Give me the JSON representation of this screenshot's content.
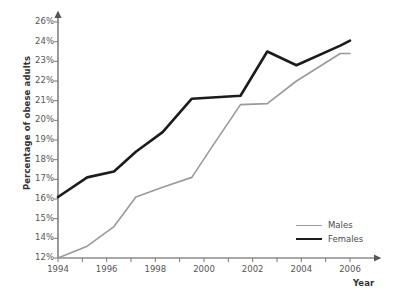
{
  "chart_data": {
    "type": "line",
    "title": "",
    "xlabel": "Year",
    "ylabel": "Percentage of obese adults",
    "xlim": [
      1994,
      2007
    ],
    "ylim": [
      12,
      26
    ],
    "grid": false,
    "legend_position": "bottom-right",
    "x_tick_labels": [
      "1994",
      "1996",
      "1998",
      "2000",
      "2002",
      "2004",
      "2006"
    ],
    "x_tick_values": [
      1994,
      1996,
      1998,
      2000,
      2002,
      2004,
      2006
    ],
    "y_tick_labels": [
      "26%",
      "24%",
      "23%",
      "22%",
      "21%",
      "20%",
      "19%",
      "18%",
      "17%",
      "16%",
      "15%",
      "14%",
      "12%"
    ],
    "y_tick_values": [
      26,
      24,
      23,
      22,
      21,
      20,
      19,
      18,
      17,
      16,
      15,
      14,
      12
    ],
    "series": [
      {
        "name": "Males",
        "color": "#9a9a9a",
        "line_width": 1.6,
        "x": [
          1994,
          1995.2,
          1996.3,
          1997.2,
          1998.3,
          1999.5,
          2000.3,
          2001.5,
          2002.6,
          2003.8,
          2005.6,
          2006
        ],
        "values": [
          12.0,
          13.2,
          14.6,
          16.1,
          16.6,
          17.1,
          18.6,
          20.8,
          20.85,
          22.0,
          23.4,
          23.4
        ]
      },
      {
        "name": "Females",
        "color": "#1c1c1c",
        "line_width": 2.6,
        "x": [
          1994,
          1995.2,
          1996.3,
          1997.2,
          1998.3,
          1999.5,
          2001.5,
          2002.6,
          2003.8,
          2005.6,
          2006
        ],
        "values": [
          16.1,
          17.1,
          17.4,
          18.4,
          19.4,
          21.1,
          21.25,
          23.5,
          22.8,
          23.8,
          24.1
        ]
      }
    ]
  },
  "legend": {
    "items": [
      {
        "label": "Males"
      },
      {
        "label": "Females"
      }
    ]
  },
  "axis": {
    "y_title": "Percentage of obese adults",
    "x_title": "Year"
  }
}
